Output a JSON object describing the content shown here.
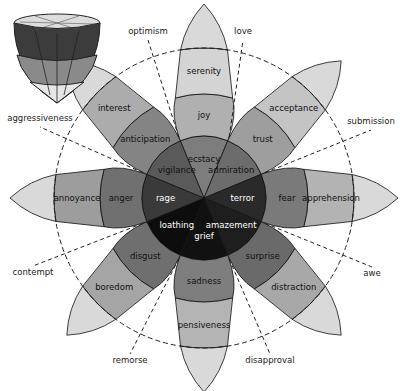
{
  "center": [
    204,
    198
  ],
  "petals": [
    {
      "angle": -90,
      "inner": "ecstacy",
      "middle": "joy",
      "outer": "serenity",
      "colors": [
        "#7d7d7d",
        "#b0b0b0",
        "#d4d4d4"
      ]
    },
    {
      "angle": -45,
      "inner": "admiration",
      "middle": "trust",
      "outer": "acceptance",
      "colors": [
        "#6c6c6c",
        "#9e9e9e",
        "#c4c4c4"
      ]
    },
    {
      "angle": 0,
      "inner": "terror",
      "middle": "fear",
      "outer": "apprehension",
      "colors": [
        "#2a2a2a",
        "#7a7a7a",
        "#b3b3b3"
      ]
    },
    {
      "angle": 45,
      "inner": "amazement",
      "middle": "surprise",
      "outer": "distraction",
      "colors": [
        "#1e1e1e",
        "#6a6a6a",
        "#a8a8a8"
      ]
    },
    {
      "angle": 90,
      "inner": "grief",
      "middle": "sadness",
      "outer": "pensiveness",
      "colors": [
        "#111111",
        "#7e7e7e",
        "#b4b4b4"
      ]
    },
    {
      "angle": 135,
      "inner": "loathing",
      "middle": "disgust",
      "outer": "boredom",
      "colors": [
        "#0d0d0d",
        "#6f6f6f",
        "#a5a5a5"
      ]
    },
    {
      "angle": 180,
      "inner": "rage",
      "middle": "anger",
      "outer": "annoyance",
      "colors": [
        "#3a3a3a",
        "#707070",
        "#9d9d9d"
      ]
    },
    {
      "angle": 225,
      "inner": "vigilance",
      "middle": "anticipation",
      "outer": "interest",
      "colors": [
        "#5a5a5a",
        "#848484",
        "#acacac"
      ]
    }
  ],
  "dyads": [
    {
      "label": "love",
      "angle": -67.5
    },
    {
      "label": "submission",
      "angle": -22.5
    },
    {
      "label": "awe",
      "angle": 22.5
    },
    {
      "label": "disapproval",
      "angle": 67.5
    },
    {
      "label": "remorse",
      "angle": 112.5
    },
    {
      "label": "contempt",
      "angle": 157.5
    },
    {
      "label": "aggressiveness",
      "angle": 202.5
    },
    {
      "label": "optimism",
      "angle": 247.5
    }
  ],
  "dyad_positions": {
    "love": [
      243,
      40
    ],
    "submission": [
      371,
      130
    ],
    "awe": [
      372,
      267
    ],
    "disapproval": [
      270,
      354
    ],
    "remorse": [
      130,
      354
    ],
    "contempt": [
      33,
      266
    ],
    "aggressiveness": [
      40,
      127
    ],
    "optimism": [
      148,
      40
    ]
  },
  "cone_icon": "3d-emotion-cone"
}
